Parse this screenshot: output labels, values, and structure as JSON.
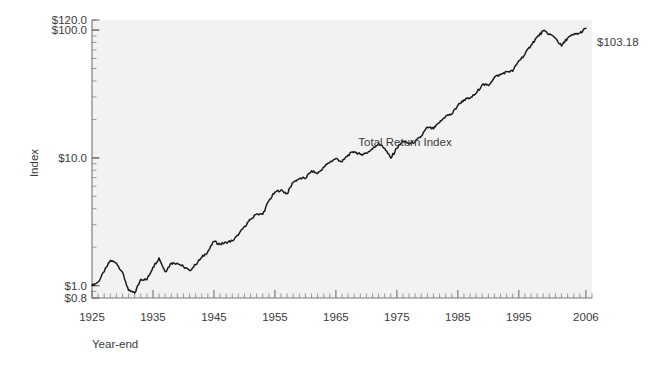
{
  "chart_data": {
    "type": "line",
    "title": "",
    "subtitle": "",
    "xlabel": "Year-end",
    "ylabel": "Index",
    "yscale": "log",
    "ylim": [
      0.8,
      120.0
    ],
    "xlim": [
      1925,
      2007
    ],
    "grid": false,
    "legend_position": "none",
    "annotations": [
      {
        "name": "series-label",
        "text": "Total Return Index",
        "x": 1971,
        "y": 17.5
      },
      {
        "name": "endpoint-value",
        "text": "$103.18",
        "x": 2007,
        "y": 103.18
      }
    ],
    "ytick_labels": [
      "$120.0",
      "$100.0",
      "$10.0",
      "$1.0",
      "$0.8"
    ],
    "ytick_values": [
      120.0,
      100.0,
      10.0,
      1.0,
      0.8
    ],
    "xtick_labels": [
      "1925",
      "1935",
      "1945",
      "1955",
      "1965",
      "1975",
      "1985",
      "1995",
      "2006"
    ],
    "xtick_values": [
      1925,
      1935,
      1945,
      1955,
      1965,
      1975,
      1985,
      1995,
      2006
    ],
    "series": [
      {
        "name": "Total Return Index",
        "color": "#1b1b1b",
        "x": [
          1925,
          1926,
          1927,
          1928,
          1929,
          1930,
          1931,
          1932,
          1933,
          1934,
          1935,
          1936,
          1937,
          1938,
          1939,
          1940,
          1941,
          1942,
          1943,
          1944,
          1945,
          1946,
          1947,
          1948,
          1949,
          1950,
          1951,
          1952,
          1953,
          1954,
          1955,
          1956,
          1957,
          1958,
          1959,
          1960,
          1961,
          1962,
          1963,
          1964,
          1965,
          1966,
          1967,
          1968,
          1969,
          1970,
          1971,
          1972,
          1973,
          1974,
          1975,
          1976,
          1977,
          1978,
          1979,
          1980,
          1981,
          1982,
          1983,
          1984,
          1985,
          1986,
          1987,
          1988,
          1989,
          1990,
          1991,
          1992,
          1993,
          1994,
          1995,
          1996,
          1997,
          1998,
          1999,
          2000,
          2001,
          2002,
          2003,
          2004,
          2005,
          2006
        ],
        "values": [
          1.0,
          1.12,
          1.54,
          2.2,
          2.02,
          1.52,
          0.86,
          0.79,
          1.22,
          1.2,
          1.78,
          2.38,
          1.54,
          2.02,
          2.01,
          1.81,
          1.6,
          1.92,
          2.42,
          2.9,
          3.96,
          3.64,
          3.85,
          4.06,
          4.83,
          6.36,
          7.89,
          9.36,
          9.26,
          14.11,
          18.56,
          19.78,
          17.65,
          25.3,
          28.32,
          28.45,
          36.11,
          32.95,
          40.47,
          47.14,
          53.01,
          47.67,
          59.1,
          65.64,
          60.06,
          62.47,
          71.41,
          84.96,
          72.5,
          53.31,
          73.14,
          90.58,
          84.08,
          89.59,
          106.11,
          140.51,
          133.61,
          162.22,
          198.75,
          211.25,
          278.34,
          330.3,
          347.7,
          405.37,
          533.54,
          517.14,
          674.62,
          725.94,
          798.98,
          809.33,
          1113.92,
          1369.45,
          1826.04,
          2348.19,
          2842.77,
          2584.18,
          2277.33,
          1774.67,
          2282.73,
          2530.85,
          2655.08,
          3077.33
        ],
        "scaled_start": 1.0,
        "scaled_end": 103.18,
        "note": "Index rebased so 1925 year-end = $1.00 and 2006 year-end = $103.18"
      }
    ]
  },
  "axis": {
    "y_title": "Index",
    "x_title": "Year-end"
  },
  "colors": {
    "plot_background": "#f2f2f2",
    "axis": "#7a7a7a",
    "line": "#1b1b1b",
    "text": "#3a3a3a"
  }
}
